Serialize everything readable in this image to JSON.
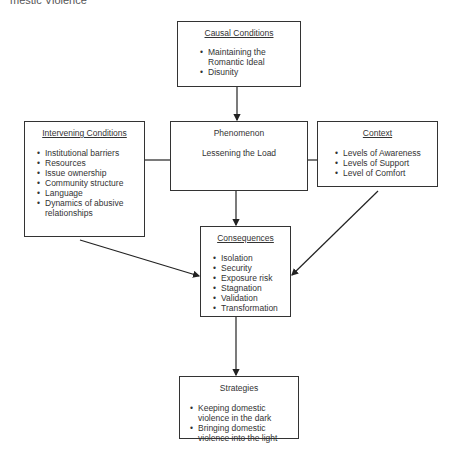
{
  "header": {
    "cut_title": "mestic Violence"
  },
  "nodes": {
    "causal": {
      "title": "Causal Conditions",
      "items": [
        "Maintaining the Romantic Ideal",
        "Disunity"
      ]
    },
    "intervening": {
      "title": "Intervening Conditions",
      "items": [
        "Institutional barriers",
        "Resources",
        "Issue ownership",
        "Community structure",
        "Language",
        "Dynamics of abusive relationships"
      ]
    },
    "phenomenon": {
      "title": "Phenomenon",
      "subtitle": "Lessening the Load"
    },
    "context": {
      "title": "Context",
      "items": [
        "Levels of Awareness",
        "Levels of Support",
        "Level of Comfort"
      ]
    },
    "consequences": {
      "title": "Consequences",
      "items": [
        "Isolation",
        "Security",
        "Exposure risk",
        "Stagnation",
        "Validation",
        "Transformation"
      ]
    },
    "strategies": {
      "title": "Strategies",
      "items": [
        "Keeping domestic violence in the dark",
        "Bringing domestic violence into the light"
      ]
    }
  },
  "edges": [
    {
      "from": "Causal Conditions",
      "to": "Phenomenon",
      "type": "arrow"
    },
    {
      "from": "Intervening Conditions",
      "to": "Phenomenon",
      "type": "line"
    },
    {
      "from": "Context",
      "to": "Phenomenon",
      "type": "line"
    },
    {
      "from": "Phenomenon",
      "to": "Consequences",
      "type": "arrow"
    },
    {
      "from": "Intervening Conditions",
      "to": "Consequences",
      "type": "arrow"
    },
    {
      "from": "Context",
      "to": "Consequences",
      "type": "arrow"
    },
    {
      "from": "Consequences",
      "to": "Strategies",
      "type": "arrow"
    }
  ]
}
